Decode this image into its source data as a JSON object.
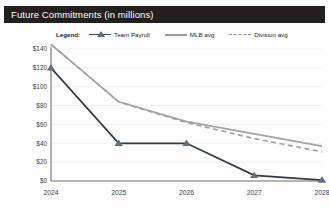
{
  "header": {
    "title": "Future Commitments (in millions)",
    "bar_color": "#231f20",
    "text_color": "#ffffff"
  },
  "legend": {
    "label": "Legend:",
    "position": "top",
    "entries": [
      {
        "name": "Team Payroll",
        "marker": "triangle-marker-icon",
        "style": "solid",
        "color": "#2f3b47"
      },
      {
        "name": "MLB avg",
        "marker": "line-swatch-icon",
        "style": "solid",
        "color": "#a3a3a3"
      },
      {
        "name": "Division avg",
        "marker": "dashed-line-swatch-icon",
        "style": "dashed",
        "color": "#a3a3a3"
      }
    ]
  },
  "chart_data": {
    "type": "line",
    "title": "Future Commitments (in millions)",
    "xlabel": "",
    "ylabel": "",
    "categories": [
      "2024",
      "2025",
      "2026",
      "2027",
      "2028"
    ],
    "x": [
      2024,
      2025,
      2026,
      2027,
      2028
    ],
    "xlim": [
      2024,
      2028
    ],
    "ylim": [
      0,
      140
    ],
    "ytick_labels": [
      "$0",
      "$20",
      "$40",
      "$60",
      "$80",
      "$100",
      "$120",
      "$140"
    ],
    "ytick_values": [
      0,
      20,
      40,
      60,
      80,
      100,
      120,
      140
    ],
    "xtick_labels": [
      "2024",
      "2025",
      "2026",
      "2027",
      "2028"
    ],
    "grid": "horizontal",
    "legend_position": "top",
    "series": [
      {
        "name": "Team Payroll",
        "values": [
          120,
          40,
          40,
          6,
          1
        ],
        "color": "#2f3b47",
        "style": "solid",
        "marker": "triangle"
      },
      {
        "name": "MLB avg",
        "values": [
          145,
          84,
          63,
          50,
          37
        ],
        "color": "#a3a3a3",
        "style": "solid",
        "marker": "none"
      },
      {
        "name": "Division avg",
        "values": [
          145,
          84,
          62,
          45,
          31
        ],
        "color": "#a3a3a3",
        "style": "dashed",
        "marker": "none"
      }
    ]
  }
}
